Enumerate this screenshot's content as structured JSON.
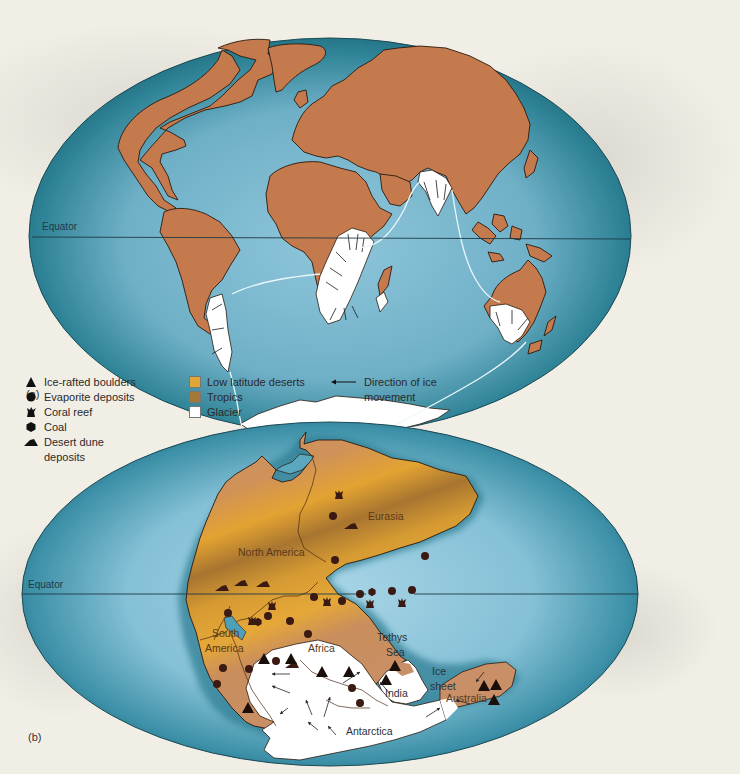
{
  "panels": {
    "a": {
      "label": "(a)",
      "equator_label": "Equator"
    },
    "b": {
      "label": "(b)",
      "equator_label": "Equator",
      "region_labels": {
        "eurasia": "Eurasia",
        "north_america": "North America",
        "south_america_line1": "South",
        "south_america_line2": "America",
        "africa": "Africa",
        "tethys_line1": "Tethys",
        "tethys_line2": "Sea",
        "ice_sheet_line1": "Ice",
        "ice_sheet_line2": "sheet",
        "india": "India",
        "australia": "Australia",
        "antarctica": "Antarctica"
      }
    }
  },
  "legend": {
    "symbols": [
      {
        "icon": "triangle-icon",
        "label": "Ice-rafted boulders"
      },
      {
        "icon": "circle-icon",
        "label": "Evaporite deposits"
      },
      {
        "icon": "coral-icon",
        "label": "Coral reef"
      },
      {
        "icon": "hexagon-icon",
        "label": "Coal"
      },
      {
        "icon": "dune-icon",
        "label": "Desert dune",
        "label2": "deposits"
      }
    ],
    "fills": [
      {
        "label": "Low latitude deserts",
        "color": "#e2a636"
      },
      {
        "label": "Tropics",
        "color": "#a47838"
      },
      {
        "label": "Glacier",
        "color": "#ffffff"
      }
    ],
    "arrow": {
      "label": "Direction of ice",
      "label2": "movement"
    }
  },
  "colors": {
    "ocean_dark": "#1f6f80",
    "ocean_light": "#8fc6db",
    "land_modern": "#c47a4c",
    "land_pangea": "#c99068",
    "desert": "#e2a636",
    "tropics": "#a47838",
    "glacier": "#ffffff",
    "symbol": "#3a1a12"
  }
}
